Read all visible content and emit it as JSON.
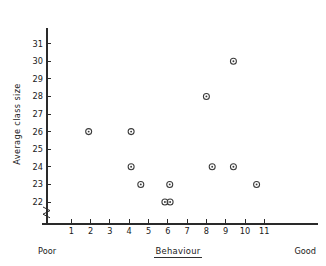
{
  "chart_data": {
    "type": "scatter",
    "title": "",
    "xlabel": "Behaviour",
    "ylabel": "Average class size",
    "xlim": [
      0,
      12
    ],
    "ylim": [
      21.5,
      31.6
    ],
    "grid": false,
    "legend": "none",
    "x_tick_labels": [
      "1",
      "2",
      "3",
      "4",
      "5",
      "6",
      "7",
      "8",
      "9",
      "10",
      "11"
    ],
    "x_ticks": [
      1,
      2,
      3,
      4,
      5,
      6,
      7,
      8,
      9,
      10,
      11
    ],
    "y_tick_labels": [
      "22",
      "23",
      "24",
      "25",
      "26",
      "27",
      "28",
      "29",
      "30",
      "31"
    ],
    "y_ticks": [
      22,
      23,
      24,
      25,
      26,
      27,
      28,
      29,
      30,
      31
    ],
    "y_axis_break": true,
    "x_axis_low_label": "Poor",
    "x_axis_high_label": "Good",
    "xlabel_underlined": true,
    "marker_style": "circle-with-center-dot",
    "marker_color": "#3a3a3a",
    "axis_color": "#2a2a2a",
    "background_color": "#ffffff",
    "points": [
      {
        "x": 1.9,
        "y": 26
      },
      {
        "x": 4.1,
        "y": 26
      },
      {
        "x": 4.1,
        "y": 24
      },
      {
        "x": 4.6,
        "y": 23
      },
      {
        "x": 5.85,
        "y": 22
      },
      {
        "x": 6.12,
        "y": 22
      },
      {
        "x": 6.1,
        "y": 23
      },
      {
        "x": 8.0,
        "y": 28
      },
      {
        "x": 8.3,
        "y": 24
      },
      {
        "x": 9.4,
        "y": 30
      },
      {
        "x": 9.4,
        "y": 24
      },
      {
        "x": 10.6,
        "y": 23
      }
    ]
  }
}
